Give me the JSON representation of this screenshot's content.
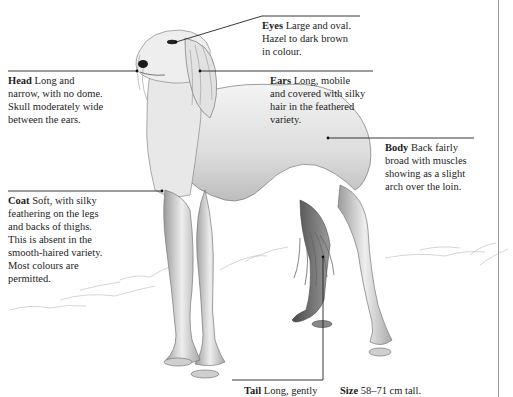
{
  "illustration": {
    "subject": "Saluki dog standing, side view, pencil sketch",
    "colors": {
      "ink": "#1c1c1c",
      "line": "#222222",
      "sketch_dark": "#555555",
      "sketch_mid": "#9a9a9a",
      "sketch_light": "#d4d4d4",
      "rule": "#9a9a9a"
    }
  },
  "annotations": {
    "eyes": {
      "title": "Eyes",
      "text": "Large and oval. Hazel to dark brown in colour.",
      "lines": [
        "Large and oval.",
        "Hazel to dark brown",
        "in colour."
      ]
    },
    "head": {
      "title": "Head",
      "text": "Long and narrow, with no dome. Skull moderately wide between the ears.",
      "lines": [
        "Long and",
        "narrow, with no dome.",
        "Skull moderately wide",
        "between the ears."
      ]
    },
    "ears": {
      "title": "Ears",
      "text": "Long, mobile and covered with silky hair in the feathered variety.",
      "lines": [
        "Long, mobile",
        "and covered with silky",
        "hair in the feathered",
        "variety."
      ]
    },
    "body": {
      "title": "Body",
      "text": "Back fairly broad with muscles showing as a slight arch over the loin.",
      "lines": [
        "Back fairly",
        "broad with muscles",
        "showing as a slight",
        "arch over the loin."
      ]
    },
    "coat": {
      "title": "Coat",
      "text": "Soft, with silky feathering on the legs and backs of thighs. This is absent in the smooth-haired variety. Most colours are permitted.",
      "lines": [
        "Soft, with silky",
        "feathering on the legs",
        "and backs of thighs.",
        "This is absent in the",
        "smooth-haired variety.",
        "Most colours are",
        "permitted."
      ]
    },
    "tail": {
      "title": "Tail",
      "text": "Long, gently",
      "lines": [
        "Long, gently"
      ]
    },
    "size": {
      "title": "Size",
      "text": "58–71 cm tall.",
      "lines": [
        "58–71 cm tall."
      ]
    }
  }
}
